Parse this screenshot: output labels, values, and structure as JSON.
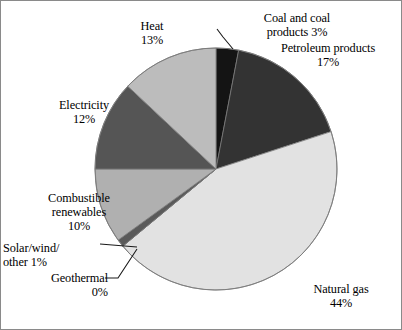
{
  "chart_data": {
    "type": "pie",
    "title": "",
    "subtitle": "",
    "xlabel": "",
    "ylabel": "",
    "legend_position": "none",
    "grid": false,
    "start_angle_deg": 0,
    "direction": "clockwise",
    "categories": [
      "Coal and coal products",
      "Petroleum products",
      "Natural gas",
      "Geothermal",
      "Solar/wind/other",
      "Combustible renewables",
      "Electricity",
      "Heat"
    ],
    "values": [
      3,
      17,
      44,
      0,
      1,
      10,
      12,
      13
    ],
    "unit": "%",
    "slices": [
      {
        "name": "Coal and coal products",
        "value": 3,
        "pct_text": "3%",
        "color": "#141414",
        "label_lines": [
          "Coal and coal",
          "products 3%"
        ],
        "leader": true
      },
      {
        "name": "Petroleum products",
        "value": 17,
        "pct_text": "17%",
        "color": "#333333",
        "label_lines": [
          "Petroleum products",
          "17%"
        ],
        "leader": false
      },
      {
        "name": "Natural gas",
        "value": 44,
        "pct_text": "44%",
        "color": "#e2e2e2",
        "label_lines": [
          "Natural gas",
          "44%"
        ],
        "leader": false
      },
      {
        "name": "Geothermal",
        "value": 0,
        "pct_text": "0%",
        "color": "#8f8f8f",
        "label_lines": [
          "Geothermal",
          "0%"
        ],
        "leader": true
      },
      {
        "name": "Solar/wind/other",
        "value": 1,
        "pct_text": "1%",
        "color": "#5a5a5a",
        "label_lines": [
          "Solar/wind/",
          "other 1%"
        ],
        "leader": true
      },
      {
        "name": "Combustible renewables",
        "value": 10,
        "pct_text": "10%",
        "color": "#b0b0b0",
        "label_lines": [
          "Combustible",
          "renewables",
          "10%"
        ],
        "leader": false
      },
      {
        "name": "Electricity",
        "value": 12,
        "pct_text": "12%",
        "color": "#555555",
        "label_lines": [
          "Electricity",
          "12%"
        ],
        "leader": false
      },
      {
        "name": "Heat",
        "value": 13,
        "pct_text": "13%",
        "color": "#bcbcbc",
        "label_lines": [
          "Heat",
          "13%"
        ],
        "leader": false
      }
    ]
  },
  "labels": {
    "coal": {
      "line1": "Coal and coal",
      "line2": "products 3%"
    },
    "petroleum": {
      "line1": "Petroleum products",
      "line2": "17%"
    },
    "natural_gas": {
      "line1": "Natural gas",
      "line2": "44%"
    },
    "geothermal": {
      "line1": "Geothermal",
      "line2": "0%"
    },
    "solar": {
      "line1": "Solar/wind/",
      "line2": "other 1%"
    },
    "combustible": {
      "line1": "Combustible",
      "line2": "renewables",
      "line3": "10%"
    },
    "electricity": {
      "line1": "Electricity",
      "line2": "12%"
    },
    "heat": {
      "line1": "Heat",
      "line2": "13%"
    }
  },
  "colors": {
    "background": "#ffffff",
    "text": "#000000",
    "border": "#8a8a8a",
    "slice_edge": "#7a7a7a",
    "leader_line": "#1a1a1a"
  }
}
